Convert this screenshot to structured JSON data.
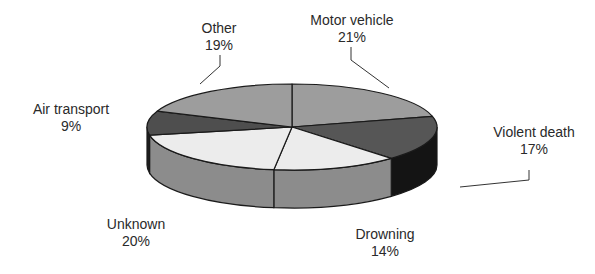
{
  "chart_data": {
    "type": "pie",
    "style": "3d",
    "title": "",
    "start_angle": "12 o'clock, clockwise",
    "categories": [
      "Motor vehicle",
      "Violent death",
      "Drowning",
      "Unknown",
      "Air transport",
      "Other"
    ],
    "values": [
      21,
      17,
      14,
      20,
      9,
      19
    ],
    "unit": "%",
    "slices": [
      {
        "label": "Motor vehicle",
        "value": 21,
        "display": "21%",
        "top_color": "#9d9d9d",
        "side_color": "#7c7c7c"
      },
      {
        "label": "Violent death",
        "value": 17,
        "display": "17%",
        "top_color": "#565656",
        "side_color": "#141414"
      },
      {
        "label": "Drowning",
        "value": 14,
        "display": "14%",
        "top_color": "#ececec",
        "side_color": "#8c8c8c"
      },
      {
        "label": "Unknown",
        "value": 20,
        "display": "20%",
        "top_color": "#ececec",
        "side_color": "#8c8c8c"
      },
      {
        "label": "Air transport",
        "value": 9,
        "display": "9%",
        "top_color": "#4e4e4e",
        "side_color": "#1e1e1e"
      },
      {
        "label": "Other",
        "value": 19,
        "display": "19%",
        "top_color": "#9d9d9d",
        "side_color": "#7c7c7c"
      }
    ],
    "legend": "none (data labels with leader lines)",
    "geometry": {
      "cx": 292,
      "cy": 127,
      "rx": 145,
      "ry": 43,
      "depth": 38
    }
  },
  "labels": [
    {
      "name": "Motor vehicle",
      "pct": "21%",
      "x": 352,
      "y": 12
    },
    {
      "name": "Violent death",
      "pct": "17%",
      "x": 534,
      "y": 124
    },
    {
      "name": "Drowning",
      "pct": "14%",
      "x": 385,
      "y": 226
    },
    {
      "name": "Unknown",
      "pct": "20%",
      "x": 136,
      "y": 216
    },
    {
      "name": "Air transport",
      "pct": "9%",
      "x": 71,
      "y": 101
    },
    {
      "name": "Other",
      "pct": "19%",
      "x": 219,
      "y": 20
    }
  ],
  "leaders": [
    {
      "points": "351,47 351,60 389,88"
    },
    {
      "points": "529,170 529,180 460,187"
    },
    {
      "points": "220,55 220,66 200,84"
    }
  ]
}
